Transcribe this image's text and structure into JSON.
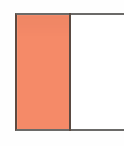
{
  "figure": {
    "background_color": "#ffffff",
    "outline_color": "#6b6a68",
    "divider_color": "#5a4a42",
    "panels": [
      {
        "name": "left-filled-panel",
        "fill_color": "#f58a68",
        "fill_label": "",
        "state": "filled"
      },
      {
        "name": "right-empty-panel",
        "fill_color": "#ffffff",
        "fill_label": "",
        "state": "empty"
      }
    ]
  }
}
